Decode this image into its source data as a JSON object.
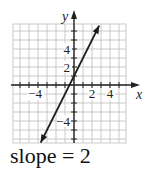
{
  "chart_data": {
    "type": "line",
    "title": "",
    "xlabel": "x",
    "ylabel": "y",
    "x_ticks_labeled": [
      -4,
      2,
      4
    ],
    "y_ticks_labeled": [
      4,
      2,
      -4
    ],
    "xlim": [
      -6.5,
      5.8
    ],
    "ylim": [
      -6.3,
      6.7
    ],
    "grid": true,
    "series": [
      {
        "name": "line",
        "equation": "y = 2x + 1",
        "slope": 2,
        "intercept": 1,
        "x": [
          -3.7,
          2.8
        ],
        "y": [
          -6.4,
          6.6
        ],
        "arrows": "both"
      }
    ]
  },
  "axis": {
    "x_label": "x",
    "y_label": "y"
  },
  "ticks": {
    "x": [
      "−4",
      "2",
      "4"
    ],
    "y": [
      "4",
      "2",
      "−4"
    ]
  },
  "caption": "slope = 2",
  "colors": {
    "grid": "#b8b8b8",
    "axis": "#222222",
    "line": "#1a1a1a"
  }
}
